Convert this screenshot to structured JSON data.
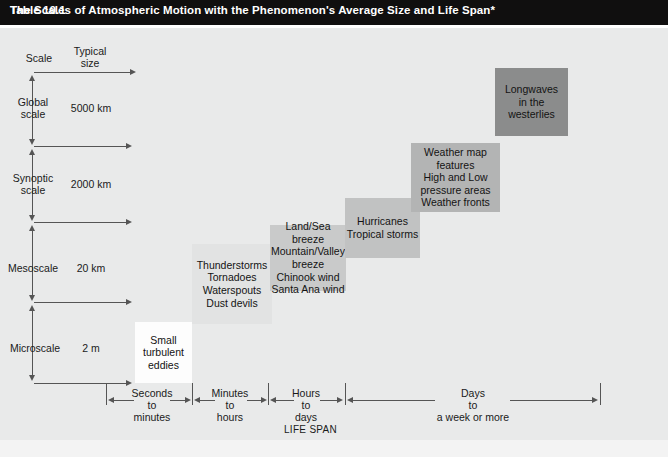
{
  "title": {
    "number": "Table 10.1",
    "text": "The Scales of Atmospheric Motion with the Phenomenon's Average Size and Life Span*"
  },
  "axes": {
    "scale_header": "Scale",
    "size_header_line1": "Typical",
    "size_header_line2": "size",
    "lifespan_label": "LIFE SPAN",
    "scale_rows": [
      {
        "name_line1": "Global",
        "name_line2": "scale",
        "size": "5000 km"
      },
      {
        "name_line1": "Synoptic",
        "name_line2": "scale",
        "size": "2000 km"
      },
      {
        "name_line1": "Mesoscale",
        "name_line2": "",
        "size": "20 km"
      },
      {
        "name_line1": "Microscale",
        "name_line2": "",
        "size": "2 m"
      }
    ],
    "lifespan_spans": [
      {
        "line1": "Seconds",
        "line2": "to",
        "line3": "minutes"
      },
      {
        "line1": "Minutes",
        "line2": "to",
        "line3": "hours"
      },
      {
        "line1": "Hours",
        "line2": "to",
        "line3": "days"
      },
      {
        "line1": "Days",
        "line2": "to",
        "line3": "a week or more"
      }
    ]
  },
  "boxes": [
    {
      "id": "small-turbulent-eddies",
      "lines": [
        "Small",
        "turbulent",
        "eddies"
      ],
      "color": "#fdfdfd"
    },
    {
      "id": "thunderstorms",
      "lines": [
        "Thunderstorms",
        "Tornadoes",
        "Waterspouts",
        "Dust devils"
      ],
      "color": "#e2e3e3"
    },
    {
      "id": "local-winds",
      "lines": [
        "Land/Sea",
        "breeze",
        "Mountain/Valley",
        "breeze",
        "Chinook wind",
        "Santa Ana wind"
      ],
      "color": "#c9caca"
    },
    {
      "id": "hurricanes",
      "lines": [
        "Hurricanes",
        "Tropical storms"
      ],
      "color": "#c1c2c2"
    },
    {
      "id": "weather-map-features",
      "lines": [
        "Weather map",
        "features",
        "High and Low",
        "pressure areas",
        "Weather fronts"
      ],
      "color": "#b3b4b4"
    },
    {
      "id": "longwaves",
      "lines": [
        "Longwaves",
        "in the",
        "westerlies"
      ],
      "color": "#8b8c8c"
    }
  ]
}
